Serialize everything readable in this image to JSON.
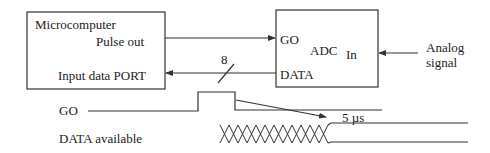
{
  "blocks": {
    "microcomputer": {
      "title": "Microcomputer",
      "pulse_out": "Pulse out",
      "input_port": "Input data PORT"
    },
    "adc": {
      "title": "ADC",
      "go": "GO",
      "data": "DATA",
      "in": "In"
    }
  },
  "signals": {
    "analog_line1": "Analog",
    "analog_line2": "signal",
    "bus_width": "8"
  },
  "timing": {
    "go_label": "GO",
    "data_label": "DATA available",
    "delay": "5 µs"
  },
  "colors": {
    "line": "#333333",
    "background": "#ffffff"
  }
}
